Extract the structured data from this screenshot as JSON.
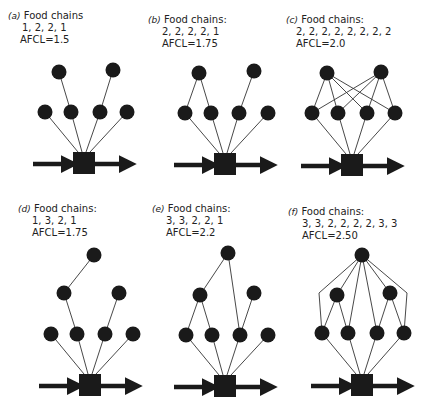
{
  "panels": [
    {
      "id": "a",
      "letter": "(a)",
      "title": "Food chains",
      "chains": "1, 2, 2, 1",
      "afcl": "AFCL=1.5",
      "edges": "a"
    },
    {
      "id": "b",
      "letter": "(b)",
      "title": "Food chains:",
      "chains": "2, 2, 2, 2, 1",
      "afcl": "AFCL=1.75",
      "edges": "b"
    },
    {
      "id": "c",
      "letter": "(c)",
      "title": "Food chains:",
      "chains": "2, 2, 2, 2, 2, 2, 2, 2",
      "afcl": "AFCL=2.0",
      "edges": "c"
    },
    {
      "id": "d",
      "letter": "(d)",
      "title": "Food chains:",
      "chains": "1, 3, 2, 1",
      "afcl": "AFCL=1.75",
      "edges": "d"
    },
    {
      "id": "e",
      "letter": "(e)",
      "title": "Food chains:",
      "chains": "3, 3, 2, 2, 1",
      "afcl": "AFCL=2.2",
      "edges": "e"
    },
    {
      "id": "f",
      "letter": "(f)",
      "title": "Food chains:",
      "chains": "3, 3, 2, 2, 2, 2, 3, 3",
      "afcl": "AFCL=2.50",
      "edges": "f"
    }
  ],
  "colors": {
    "node": "#1a1a1a",
    "line": "#333333",
    "text": "#222222"
  }
}
